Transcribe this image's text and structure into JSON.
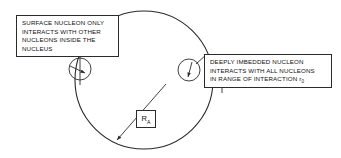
{
  "figure": {
    "stroke_color": "#2b2b2b",
    "background_color": "#ffffff",
    "text_color": "#111111"
  },
  "nucleus": {
    "label": "nucleus-circle",
    "center_x": 144,
    "center_y": 80,
    "radius": 69
  },
  "nucleons": [
    {
      "id": "surface-nucleon",
      "center_x": 80,
      "center_y": 69,
      "radius": 11
    },
    {
      "id": "embedded-nucleon",
      "center_x": 189,
      "center_y": 70,
      "radius": 11
    }
  ],
  "callouts": {
    "surface": {
      "name": "surface-nucleon-callout",
      "lines": [
        "SURFACE NUCLEON ONLY",
        "INTERACTS WITH OTHER",
        "NUCLEONS INSIDE THE",
        "NUCLEUS"
      ]
    },
    "embedded": {
      "name": "embedded-nucleon-callout",
      "lines": [
        "DEEPLY IMBEDDED NUCLEON",
        "INTERACTS WITH ALL NUCLEONS",
        "IN RANGE OF INTERACTION r"
      ],
      "last_line_subscript": "0"
    }
  },
  "radius_annotation": {
    "name": "nuclear-radius-label",
    "symbol": "R",
    "subscript": "A",
    "line_from": {
      "x": 166,
      "y": 84
    },
    "line_to": {
      "x": 117,
      "y": 140
    }
  }
}
